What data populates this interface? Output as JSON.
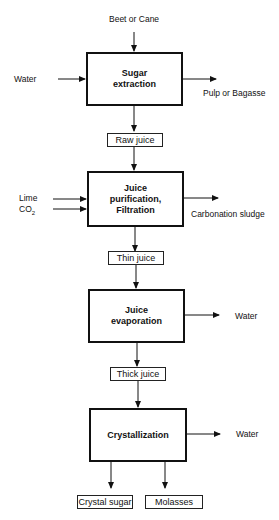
{
  "diagram": {
    "type": "process-flow",
    "inputs": {
      "feed": "Beet or Cane",
      "extraction_water": "Water",
      "lime": "Lime",
      "co2_prefix": "CO",
      "co2_sub": "2"
    },
    "processes": [
      {
        "id": "sugar-extraction",
        "label": "Sugar\nextraction"
      },
      {
        "id": "juice-purification",
        "label": "Juice\npurification,\nFiltration"
      },
      {
        "id": "juice-evaporation",
        "label": "Juice\nevaporation"
      },
      {
        "id": "crystallization",
        "label": "Crystallization"
      }
    ],
    "streams": {
      "raw_juice": "Raw juice",
      "thin_juice": "Thin juice",
      "thick_juice": "Thick juice",
      "crystal_sugar": "Crystal sugar",
      "molasses": "Molasses"
    },
    "outputs": {
      "pulp": "Pulp or Bagasse",
      "sludge": "Carbonation sludge",
      "evap_water": "Water",
      "cryst_water": "Water"
    },
    "colors": {
      "line": "#111111",
      "background": "#ffffff"
    }
  }
}
